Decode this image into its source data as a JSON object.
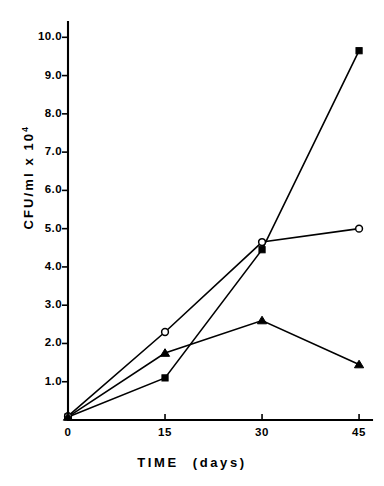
{
  "chart_data": {
    "type": "line",
    "title": "",
    "subtitle": "",
    "xlabel": "TIME   (days)",
    "xlabel_main": "TIME",
    "xlabel_unit": "(days)",
    "ylabel": "CFU/ml x 10",
    "ylabel_exponent": "4",
    "ylabel_full": "CFU/ml x 10^4",
    "x": [
      0,
      15,
      30,
      45
    ],
    "xlim": [
      0,
      47
    ],
    "ylim": [
      0,
      10.4
    ],
    "xticks": [
      0,
      15,
      30,
      45
    ],
    "xtick_labels": [
      "0",
      "15",
      "30",
      "45"
    ],
    "yticks": [
      1.0,
      2.0,
      3.0,
      4.0,
      5.0,
      6.0,
      7.0,
      8.0,
      9.0,
      10.0
    ],
    "ytick_labels": [
      "1.0",
      "2.0",
      "3.0",
      "4.0",
      "5.0",
      "6.0",
      "7.0",
      "8.0",
      "9.0",
      "10.0"
    ],
    "grid": false,
    "legend": "none",
    "series": [
      {
        "name": "filled-square-series",
        "marker": "filled-square",
        "color": "#000000",
        "values": [
          0.08,
          1.1,
          4.45,
          9.65
        ]
      },
      {
        "name": "open-circle-series",
        "marker": "open-circle",
        "color": "#000000",
        "values": [
          0.1,
          2.3,
          4.65,
          5.0
        ]
      },
      {
        "name": "filled-triangle-series",
        "marker": "filled-triangle",
        "color": "#000000",
        "values": [
          0.08,
          1.75,
          2.6,
          1.45
        ]
      }
    ]
  },
  "figure": {
    "background_color": "#ffffff",
    "axis_color": "#000000"
  }
}
